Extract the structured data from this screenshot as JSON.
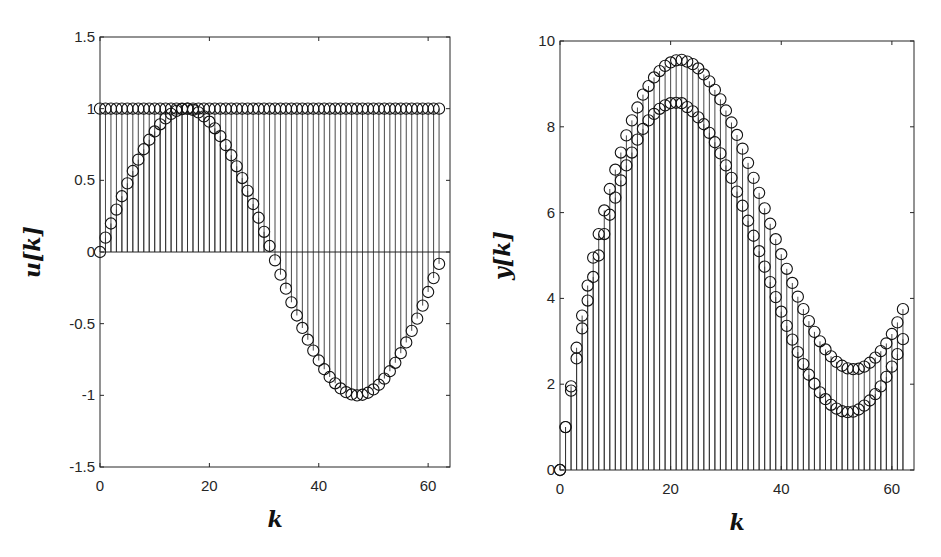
{
  "chart_data": [
    {
      "type": "stem",
      "panel": "left",
      "title": "",
      "xlabel": "k",
      "ylabel": "u[k]",
      "xlim": [
        0,
        64
      ],
      "ylim": [
        -1.5,
        1.5
      ],
      "xticks": [
        0,
        20,
        40,
        60
      ],
      "yticks": [
        -1.5,
        -1,
        -0.5,
        0,
        0.5,
        1,
        1.5
      ],
      "ytick_labels": [
        "-1.5",
        "-1",
        "-0.5",
        "0",
        "0.5",
        "1",
        "1.5"
      ],
      "grid": false,
      "baseline": 0,
      "marker": "open-circle",
      "series": [
        {
          "name": "u1 (constant)",
          "x": [
            0,
            1,
            2,
            3,
            4,
            5,
            6,
            7,
            8,
            9,
            10,
            11,
            12,
            13,
            14,
            15,
            16,
            17,
            18,
            19,
            20,
            21,
            22,
            23,
            24,
            25,
            26,
            27,
            28,
            29,
            30,
            31,
            32,
            33,
            34,
            35,
            36,
            37,
            38,
            39,
            40,
            41,
            42,
            43,
            44,
            45,
            46,
            47,
            48,
            49,
            50,
            51,
            52,
            53,
            54,
            55,
            56,
            57,
            58,
            59,
            60,
            61,
            62
          ],
          "values": [
            1,
            1,
            1,
            1,
            1,
            1,
            1,
            1,
            1,
            1,
            1,
            1,
            1,
            1,
            1,
            1,
            1,
            1,
            1,
            1,
            1,
            1,
            1,
            1,
            1,
            1,
            1,
            1,
            1,
            1,
            1,
            1,
            1,
            1,
            1,
            1,
            1,
            1,
            1,
            1,
            1,
            1,
            1,
            1,
            1,
            1,
            1,
            1,
            1,
            1,
            1,
            1,
            1,
            1,
            1,
            1,
            1,
            1,
            1,
            1,
            1,
            1,
            1
          ]
        },
        {
          "name": "u2 (sinusoid)",
          "x": [
            0,
            1,
            2,
            3,
            4,
            5,
            6,
            7,
            8,
            9,
            10,
            11,
            12,
            13,
            14,
            15,
            16,
            17,
            18,
            19,
            20,
            21,
            22,
            23,
            24,
            25,
            26,
            27,
            28,
            29,
            30,
            31,
            32,
            33,
            34,
            35,
            36,
            37,
            38,
            39,
            40,
            41,
            42,
            43,
            44,
            45,
            46,
            47,
            48,
            49,
            50,
            51,
            52,
            53,
            54,
            55,
            56,
            57,
            58,
            59,
            60,
            61,
            62
          ],
          "values": [
            0,
            0.1,
            0.199,
            0.296,
            0.389,
            0.479,
            0.565,
            0.644,
            0.717,
            0.783,
            0.841,
            0.891,
            0.932,
            0.964,
            0.985,
            0.997,
            1.0,
            0.992,
            0.974,
            0.946,
            0.909,
            0.863,
            0.808,
            0.746,
            0.675,
            0.598,
            0.516,
            0.427,
            0.335,
            0.239,
            0.141,
            0.042,
            -0.058,
            -0.158,
            -0.256,
            -0.351,
            -0.443,
            -0.53,
            -0.612,
            -0.688,
            -0.757,
            -0.818,
            -0.872,
            -0.916,
            -0.952,
            -0.978,
            -0.994,
            -1.0,
            -0.996,
            -0.982,
            -0.959,
            -0.926,
            -0.883,
            -0.832,
            -0.773,
            -0.706,
            -0.631,
            -0.55,
            -0.465,
            -0.374,
            -0.279,
            -0.182,
            -0.083
          ]
        }
      ]
    },
    {
      "type": "stem",
      "panel": "right",
      "title": "",
      "xlabel": "k",
      "ylabel": "y[k]",
      "xlim": [
        0,
        64
      ],
      "ylim": [
        0,
        10
      ],
      "xticks": [
        0,
        20,
        40,
        60
      ],
      "yticks": [
        0,
        2,
        4,
        6,
        8,
        10
      ],
      "ytick_labels": [
        "0",
        "2",
        "4",
        "6",
        "8",
        "10"
      ],
      "grid": false,
      "baseline": 0,
      "marker": "open-circle",
      "series": [
        {
          "name": "y1 (upper)",
          "x": [
            0,
            1,
            2,
            3,
            4,
            5,
            6,
            7,
            8,
            9,
            10,
            11,
            12,
            13,
            14,
            15,
            16,
            17,
            18,
            19,
            20,
            21,
            22,
            23,
            24,
            25,
            26,
            27,
            28,
            29,
            30,
            31,
            32,
            33,
            34,
            35,
            36,
            37,
            38,
            39,
            40,
            41,
            42,
            43,
            44,
            45,
            46,
            47,
            48,
            49,
            50,
            51,
            52,
            53,
            54,
            55,
            56,
            57,
            58,
            59,
            60,
            61,
            62
          ],
          "values": [
            0,
            1.0,
            1.95,
            2.85,
            3.6,
            4.3,
            4.95,
            5.5,
            6.05,
            6.55,
            7.0,
            7.4,
            7.8,
            8.15,
            8.45,
            8.75,
            8.95,
            9.15,
            9.3,
            9.42,
            9.5,
            9.55,
            9.56,
            9.52,
            9.46,
            9.36,
            9.22,
            9.06,
            8.86,
            8.64,
            8.38,
            8.1,
            7.81,
            7.49,
            7.16,
            6.81,
            6.46,
            6.1,
            5.74,
            5.38,
            5.03,
            4.69,
            4.36,
            4.04,
            3.75,
            3.47,
            3.22,
            3.0,
            2.81,
            2.65,
            2.52,
            2.43,
            2.37,
            2.35,
            2.36,
            2.41,
            2.5,
            2.62,
            2.77,
            2.95,
            3.17,
            3.44,
            3.75
          ]
        },
        {
          "name": "y2 (lower)",
          "x": [
            0,
            1,
            2,
            3,
            4,
            5,
            6,
            7,
            8,
            9,
            10,
            11,
            12,
            13,
            14,
            15,
            16,
            17,
            18,
            19,
            20,
            21,
            22,
            23,
            24,
            25,
            26,
            27,
            28,
            29,
            30,
            31,
            32,
            33,
            34,
            35,
            36,
            37,
            38,
            39,
            40,
            41,
            42,
            43,
            44,
            45,
            46,
            47,
            48,
            49,
            50,
            51,
            52,
            53,
            54,
            55,
            56,
            57,
            58,
            59,
            60,
            61,
            62
          ],
          "values": [
            0,
            1.0,
            1.85,
            2.6,
            3.3,
            3.95,
            4.5,
            5.0,
            5.5,
            5.95,
            6.35,
            6.75,
            7.1,
            7.4,
            7.7,
            7.95,
            8.15,
            8.3,
            8.42,
            8.5,
            8.55,
            8.56,
            8.55,
            8.46,
            8.36,
            8.22,
            8.06,
            7.86,
            7.64,
            7.38,
            7.1,
            6.81,
            6.49,
            6.16,
            5.81,
            5.46,
            5.1,
            4.74,
            4.38,
            4.03,
            3.69,
            3.36,
            3.04,
            2.75,
            2.47,
            2.22,
            2.01,
            1.81,
            1.65,
            1.52,
            1.43,
            1.37,
            1.35,
            1.36,
            1.41,
            1.5,
            1.62,
            1.77,
            1.95,
            2.17,
            2.41,
            2.7,
            3.05
          ]
        }
      ]
    }
  ]
}
